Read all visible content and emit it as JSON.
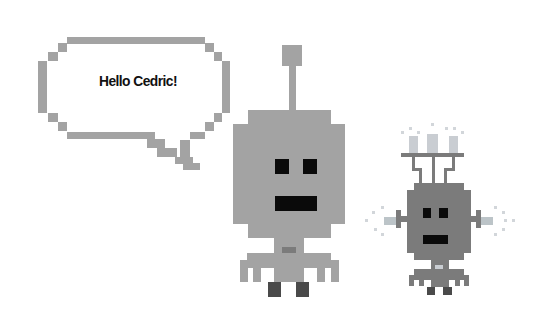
{
  "scene": {
    "speech_bubble": {
      "text": "Hello Cedric!"
    },
    "characters": [
      {
        "name": "big-robot",
        "body_color": "#a3a3a3",
        "feature_color": "#0a0a0a"
      },
      {
        "name": "small-robot",
        "body_color": "#7b7b7b",
        "feature_color": "#0a0a0a"
      }
    ],
    "colors": {
      "background": "#ffffff",
      "bubble_outline": "#a3a3a3",
      "text": "#111111"
    }
  }
}
